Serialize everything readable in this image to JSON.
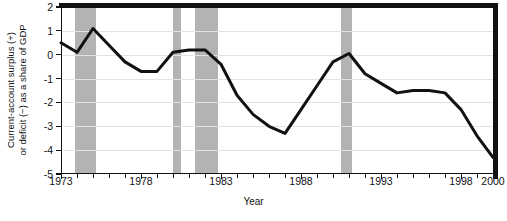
{
  "chart_data": {
    "type": "line",
    "title": "",
    "xlabel": "Year",
    "ylabel": "Current-account surplus (+) or deficit (−) as a share of GDP",
    "ylabel_line1": "Current-account surplus (+)",
    "ylabel_line2": "or deficit (−) as a share of GDP",
    "xlim": [
      1973,
      2000
    ],
    "ylim": [
      -5,
      2
    ],
    "grid": true,
    "legend": "none",
    "xticklabels": [
      "1973",
      "1978",
      "1983",
      "1988",
      "1993",
      "1998",
      "2000"
    ],
    "xtickvalues": [
      1973,
      1978,
      1983,
      1988,
      1993,
      1998,
      2000
    ],
    "xminorticks": [
      1974,
      1975,
      1976,
      1977,
      1979,
      1980,
      1981,
      1982,
      1984,
      1985,
      1986,
      1987,
      1989,
      1990,
      1991,
      1992,
      1994,
      1995,
      1996,
      1997,
      1999
    ],
    "yticklabels": [
      "2",
      "1",
      "0",
      "-1",
      "-2",
      "-3",
      "-4",
      "-5"
    ],
    "ytickvalues": [
      2,
      1,
      0,
      -1,
      -2,
      -3,
      -4,
      -5
    ],
    "series_name": "Current-account balance",
    "line_color": "#111111",
    "band_color": "#b3b3b3",
    "grid_color": "#e2e2e2",
    "x": [
      1973,
      1974,
      1975,
      1976,
      1977,
      1978,
      1979,
      1980,
      1981,
      1982,
      1983,
      1984,
      1985,
      1986,
      1987,
      1988,
      1989,
      1990,
      1991,
      1992,
      1993,
      1994,
      1995,
      1996,
      1997,
      1998,
      1999,
      2000
    ],
    "values": [
      0.5,
      0.1,
      1.1,
      0.4,
      -0.3,
      -0.7,
      -0.7,
      0.1,
      0.2,
      0.2,
      -0.4,
      -1.7,
      -2.5,
      -3.0,
      -3.3,
      -2.3,
      -1.3,
      -0.3,
      0.05,
      -0.8,
      -1.2,
      -1.6,
      -1.5,
      -1.5,
      -1.6,
      -2.3,
      -3.4,
      -4.3
    ],
    "shaded_bands": [
      {
        "name": "recession-1973-1975",
        "start": 1973.9,
        "end": 1975.2
      },
      {
        "name": "recession-1980",
        "start": 1980.0,
        "end": 1980.5
      },
      {
        "name": "recession-1981-1982",
        "start": 1981.4,
        "end": 1982.8
      },
      {
        "name": "recession-1990-1991",
        "start": 1990.5,
        "end": 1991.2
      }
    ]
  }
}
